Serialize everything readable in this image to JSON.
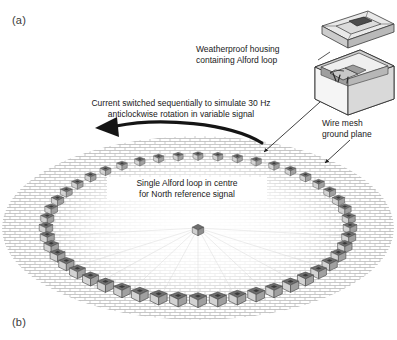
{
  "figure": {
    "panels": [
      {
        "id": "a",
        "label": "(a)"
      },
      {
        "id": "b",
        "label": "(b)"
      }
    ],
    "callouts": {
      "housing": "Weatherproof housing\ncontaining Alford loop",
      "rotation": "Current switched sequentially to simulate 30 Hz\nanticlockwise rotation in variable signal",
      "mesh": "Wire mesh\nground plane",
      "centre": "Single Alford loop in centre\nfor North reference signal"
    },
    "colors": {
      "background": "#ffffff",
      "text": "#1a1a1a",
      "panel_label": "#3a3a3a",
      "mesh_line": "#9a9a9a",
      "box_top": "#6e6e6e",
      "box_front": "#d2d2d2",
      "box_side": "#a0a0a0",
      "box_outline": "#4a4a4a",
      "housing_face": "#e6e6e6",
      "housing_shade": "#b5b5b5",
      "housing_dark": "#808080",
      "arrow": "#151515",
      "leader": "#2a2a2a"
    },
    "geometry": {
      "mesh_ellipse": {
        "cx": 198,
        "cy": 228,
        "rx": 196,
        "ry": 92
      },
      "ring_ellipse": {
        "cx": 198,
        "cy": 228,
        "rx": 152,
        "ry": 72
      },
      "ring_box_count": 48,
      "centre_loop": {
        "x": 198,
        "y": 230
      },
      "rotation_arrow": {
        "direction": "anticlockwise",
        "frequency_hz": 30
      }
    }
  }
}
